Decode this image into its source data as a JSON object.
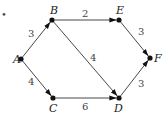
{
  "diagram": {
    "type": "directed-weighted-graph",
    "bullet": "•",
    "nodes": [
      {
        "id": "A",
        "label": "A",
        "x": 21,
        "y": 59,
        "lx": 13,
        "ly": 63
      },
      {
        "id": "B",
        "label": "B",
        "x": 52,
        "y": 20,
        "lx": 50,
        "ly": 14
      },
      {
        "id": "C",
        "label": "C",
        "x": 53,
        "y": 98,
        "lx": 49,
        "ly": 112
      },
      {
        "id": "D",
        "label": "D",
        "x": 119,
        "y": 98,
        "lx": 114,
        "ly": 112
      },
      {
        "id": "E",
        "label": "E",
        "x": 119,
        "y": 20,
        "lx": 116,
        "ly": 14
      },
      {
        "id": "F",
        "label": "F",
        "x": 150,
        "y": 58,
        "lx": 154,
        "ly": 62
      }
    ],
    "edges": [
      {
        "from": "A",
        "to": "B",
        "weight": "3",
        "wx": 28,
        "wy": 37
      },
      {
        "from": "A",
        "to": "C",
        "weight": "4",
        "wx": 28,
        "wy": 85
      },
      {
        "from": "B",
        "to": "E",
        "weight": "2",
        "wx": 82,
        "wy": 17
      },
      {
        "from": "B",
        "to": "D",
        "weight": "4",
        "wx": 90,
        "wy": 61
      },
      {
        "from": "C",
        "to": "D",
        "weight": "6",
        "wx": 82,
        "wy": 110
      },
      {
        "from": "E",
        "to": "F",
        "weight": "3",
        "wx": 138,
        "wy": 35
      },
      {
        "from": "D",
        "to": "F",
        "weight": "3",
        "wx": 138,
        "wy": 87
      }
    ]
  }
}
